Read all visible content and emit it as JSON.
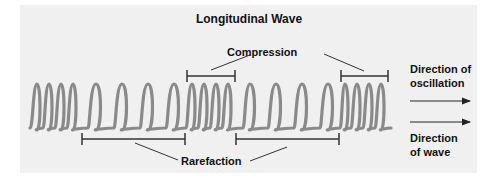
{
  "diagram": {
    "title": "Longitudinal Wave",
    "labels": {
      "compression": "Compression",
      "rarefaction": "Rarefaction",
      "direction_of_oscillation_line1": "Direction of",
      "direction_of_oscillation_line2": "oscillation",
      "direction_of_wave_line1": "Direction",
      "direction_of_wave_line2": "of wave"
    },
    "colors": {
      "panel_background": "#f0f0f0",
      "coil": "#8a8a8a",
      "lines": "#222222"
    },
    "coil_loops": {
      "compressed_groups": [
        [
          37,
          49,
          61,
          73
        ],
        [
          192,
          204,
          216,
          228
        ],
        [
          345,
          357,
          369,
          381
        ]
      ],
      "expanded_groups": [
        [
          96,
          122,
          148,
          174
        ],
        [
          250,
          276,
          302,
          328
        ]
      ]
    },
    "brackets": {
      "compression": [
        {
          "x1": 187,
          "x2": 235,
          "y": 76
        },
        {
          "x1": 341,
          "x2": 388,
          "y": 76
        }
      ],
      "rarefaction": [
        {
          "x1": 82,
          "x2": 185,
          "y": 139
        },
        {
          "x1": 236,
          "x2": 339,
          "y": 139
        }
      ]
    },
    "arrows": [
      {
        "name": "direction-of-oscillation-arrow",
        "x1": 410,
        "x2": 470,
        "y": 101
      },
      {
        "name": "direction-of-wave-arrow",
        "x1": 410,
        "x2": 470,
        "y": 122
      }
    ]
  }
}
